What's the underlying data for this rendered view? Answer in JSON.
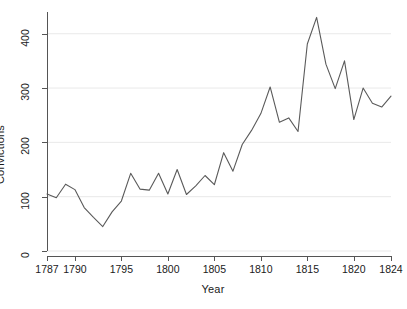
{
  "chart_data": {
    "type": "line",
    "title": "",
    "xlabel": "Year",
    "ylabel": "Convictions",
    "xlim": [
      1787,
      1824
    ],
    "ylim": [
      0,
      440
    ],
    "grid": "horizontal",
    "legend": "none",
    "x_ticks": [
      1787,
      1790,
      1795,
      1800,
      1805,
      1810,
      1815,
      1820,
      1824
    ],
    "x_tick_labels": [
      "1787",
      "1790",
      "1795",
      "1800",
      "1805",
      "1810",
      "1815",
      "1820",
      "1824"
    ],
    "y_ticks": [
      0,
      100,
      200,
      300,
      400
    ],
    "y_tick_labels": [
      "0",
      "100",
      "200",
      "300",
      "400"
    ],
    "series": [
      {
        "name": "Convictions",
        "color": "#5a5a5a",
        "x": [
          1787,
          1788,
          1789,
          1790,
          1791,
          1792,
          1793,
          1794,
          1795,
          1796,
          1797,
          1798,
          1799,
          1800,
          1801,
          1802,
          1803,
          1804,
          1805,
          1806,
          1807,
          1808,
          1809,
          1810,
          1811,
          1812,
          1813,
          1814,
          1815,
          1816,
          1817,
          1818,
          1819,
          1820,
          1821,
          1822,
          1823,
          1824
        ],
        "values": [
          105,
          98,
          123,
          113,
          80,
          62,
          45,
          72,
          92,
          143,
          114,
          112,
          143,
          105,
          150,
          104,
          120,
          139,
          122,
          181,
          147,
          196,
          222,
          253,
          302,
          237,
          245,
          220,
          381,
          430,
          344,
          299,
          350,
          242,
          300,
          272,
          265,
          285
        ]
      }
    ]
  },
  "axis": {
    "y_title": "Convictions",
    "x_title": "Year"
  }
}
